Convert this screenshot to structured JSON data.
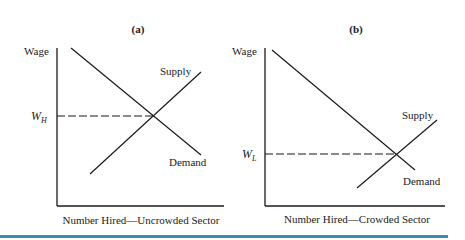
{
  "panels": [
    {
      "title": "(a)",
      "ylabel": "Wage",
      "xlabel": "Number Hired—Uncrowded Sector",
      "wage_symbol": "W",
      "wage_subscript": "H",
      "supply_label": "Supply",
      "demand_label": "Demand"
    },
    {
      "title": "(b)",
      "ylabel": "Wage",
      "xlabel": "Number Hired—Crowded Sector",
      "wage_symbol": "W",
      "wage_subscript": "L",
      "supply_label": "Supply",
      "demand_label": "Demand"
    }
  ],
  "colors": {
    "line": "#1a1a1a",
    "rule": "#3f8aa6"
  }
}
